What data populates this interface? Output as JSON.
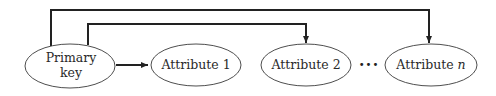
{
  "diagram": {
    "type": "functional-dependency",
    "nodes": [
      {
        "id": "pk",
        "label_line1": "Primary",
        "label_line2": "key"
      },
      {
        "id": "a1",
        "label": "Attribute 1"
      },
      {
        "id": "a2",
        "label": "Attribute 2"
      },
      {
        "id": "an",
        "label_prefix": "Attribute ",
        "label_var": "n"
      }
    ],
    "ellipsis": "•••",
    "edges": [
      {
        "from": "pk",
        "to": "a1",
        "style": "direct"
      },
      {
        "from": "pk",
        "to": "a2",
        "style": "over-top"
      },
      {
        "from": "pk",
        "to": "an",
        "style": "over-top"
      }
    ]
  }
}
